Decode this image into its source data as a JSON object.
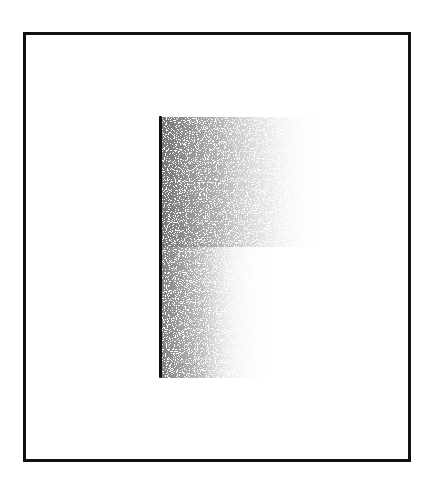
{
  "diagram": {
    "frame": {
      "stroke_color": "#111111",
      "fill_color": "#ffffff"
    },
    "edge_line": {
      "color": "#111111",
      "orientation": "vertical"
    },
    "shading": {
      "style": "stippled gradient",
      "direction": "dark at left edge fading to right",
      "dark_color": "#6e6e6e",
      "light_color": "#ffffff"
    }
  }
}
